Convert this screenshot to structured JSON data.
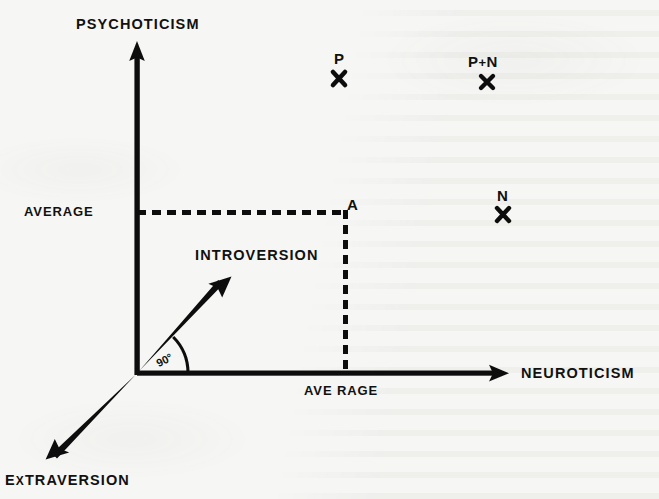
{
  "figure": {
    "type": "axis-diagram",
    "background_color": "#f6f6f4",
    "ink_color": "#111110"
  },
  "axes": {
    "vertical": {
      "label": "PSYCHOTICISM",
      "label_x": 137,
      "label_y": 24,
      "arrow_from": [
        137,
        373
      ],
      "arrow_to": [
        137,
        42
      ]
    },
    "horizontal": {
      "label": "NEUROTICISM",
      "label_x": 578,
      "label_y": 373,
      "arrow_from": [
        137,
        373
      ],
      "arrow_to": [
        508,
        373
      ]
    },
    "diagonal_up": {
      "label": "INTROVERSION",
      "label_x": 258,
      "label_y": 255,
      "arrow_from": [
        137,
        373
      ],
      "arrow_to": [
        230,
        278
      ]
    },
    "diagonal_down": {
      "label": "EXTRAVERSION",
      "label_x": 73,
      "label_y": 482,
      "arrow_from": [
        137,
        373
      ],
      "arrow_to": [
        47,
        458
      ]
    }
  },
  "angle": {
    "value": "90°",
    "label_x": 166,
    "label_y": 362
  },
  "ticks": [
    {
      "name": "average-psychoticism",
      "label": "AVERAGE",
      "label_x": 67,
      "label_y": 212,
      "axis": "vertical"
    },
    {
      "name": "average-neuroticism",
      "label": "AVE RAGE",
      "label_x": 345,
      "label_y": 392,
      "axis": "horizontal"
    }
  ],
  "projection": {
    "corner_label": "A",
    "corner_label_x": 352,
    "corner_label_y": 205,
    "corner_point": [
      345,
      212
    ],
    "horizontal_dash_from": [
      137,
      212
    ],
    "horizontal_dash_to": [
      345,
      212
    ],
    "vertical_dash_from": [
      345,
      212
    ],
    "vertical_dash_to": [
      345,
      373
    ]
  },
  "data_points": [
    {
      "name": "point-p",
      "label": "P",
      "label_x": 340,
      "label_y": 58,
      "marker": "x",
      "marker_x": 339,
      "marker_y": 79
    },
    {
      "name": "point-p-plus-n",
      "label": "P + N",
      "label_left": "P",
      "label_plus": "+",
      "label_right": "N",
      "label_x": 489,
      "label_y": 61,
      "marker": "x",
      "marker_x": 487,
      "marker_y": 82
    },
    {
      "name": "point-n",
      "label": "N",
      "label_x": 503,
      "label_y": 195,
      "marker": "x",
      "marker_x": 503,
      "marker_y": 215
    }
  ]
}
